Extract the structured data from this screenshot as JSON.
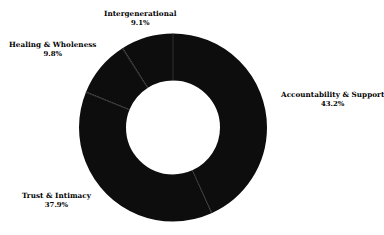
{
  "chart_data": {
    "type": "pie",
    "variant": "donut",
    "title": "",
    "subtitle": "",
    "xlabel": "",
    "ylabel": "",
    "legend": "none",
    "grid": false,
    "units": "percent",
    "total": 100.0,
    "hole_ratio": 0.5,
    "start_angle_deg": 0,
    "direction": "clockwise",
    "categories": [
      "Accountability & Support",
      "Trust & Intimacy",
      "Healing & Wholeness",
      "Intergenerational"
    ],
    "values": [
      43.2,
      37.9,
      9.8,
      9.1
    ],
    "slice_colors": [
      "#0d0d0d",
      "#0d0d0d",
      "#0d0d0d",
      "#0d0d0d"
    ],
    "slices": [
      {
        "label": "Accountability & Support",
        "value": 43.2,
        "value_text": "43.2%",
        "color": "#0d0d0d"
      },
      {
        "label": "Trust & Intimacy",
        "value": 37.9,
        "value_text": "37.9%",
        "color": "#0d0d0d"
      },
      {
        "label": "Healing & Wholeness",
        "value": 9.8,
        "value_text": "9.8%",
        "color": "#0d0d0d"
      },
      {
        "label": "Intergenerational",
        "value": 9.1,
        "value_text": "9.1%",
        "color": "#0d0d0d"
      }
    ]
  },
  "figure": {
    "background_color": "#ffffff",
    "separator_color": "#3a3a3a",
    "center_x": 173,
    "center_y": 127.5,
    "outer_radius": 94,
    "inner_radius": 47
  }
}
